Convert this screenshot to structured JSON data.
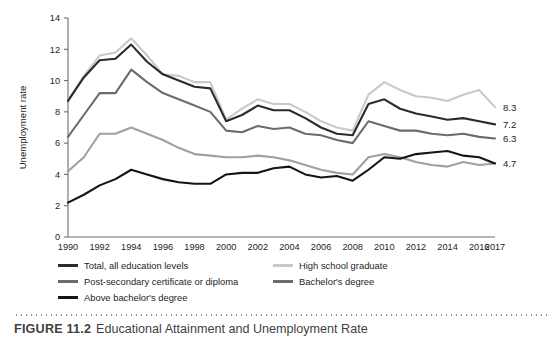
{
  "figure": {
    "caption_label": "FIGURE 11.2",
    "caption_text": "Educational Attainment and Unemployment Rate"
  },
  "chart_data": {
    "type": "line",
    "title": "",
    "xlabel": "",
    "ylabel": "Unemployment rate",
    "xlim": [
      1990,
      2017
    ],
    "ylim": [
      0,
      14
    ],
    "yticks": [
      0,
      2,
      4,
      6,
      8,
      10,
      12,
      14
    ],
    "grid": false,
    "legend_position": "below",
    "x": [
      1990,
      1991,
      1992,
      1993,
      1994,
      1995,
      1996,
      1997,
      1998,
      1999,
      2000,
      2001,
      2002,
      2003,
      2004,
      2005,
      2006,
      2007,
      2008,
      2009,
      2010,
      2011,
      2012,
      2013,
      2014,
      2015,
      2016,
      2017
    ],
    "xtick_labels": [
      "1990",
      "1992",
      "1994",
      "1996",
      "1998",
      "2000",
      "2002",
      "2004",
      "2006",
      "2008",
      "2010",
      "2012",
      "2014",
      "2016",
      "2017"
    ],
    "xtick_values": [
      1990,
      1992,
      1994,
      1996,
      1998,
      2000,
      2002,
      2004,
      2006,
      2008,
      2010,
      2012,
      2014,
      2016,
      2017
    ],
    "series": [
      {
        "name": "High school graduate",
        "color": "#c9c9cb",
        "end_label": "8.3",
        "values": [
          8.7,
          10.3,
          11.6,
          11.8,
          12.7,
          11.6,
          10.4,
          10.3,
          9.9,
          9.9,
          7.5,
          8.2,
          8.8,
          8.5,
          8.5,
          8.0,
          7.4,
          7.0,
          6.8,
          9.1,
          9.9,
          9.4,
          9.0,
          8.9,
          8.7,
          9.1,
          9.4,
          8.3
        ]
      },
      {
        "name": "Total, all education levels",
        "color": "#2b2b2e",
        "end_label": "7.2",
        "values": [
          8.7,
          10.2,
          11.3,
          11.4,
          12.3,
          11.2,
          10.4,
          10.0,
          9.6,
          9.5,
          7.4,
          7.8,
          8.4,
          8.1,
          8.1,
          7.6,
          7.0,
          6.6,
          6.5,
          8.5,
          8.8,
          8.2,
          7.9,
          7.7,
          7.5,
          7.6,
          7.4,
          7.2
        ]
      },
      {
        "name": "Post-secondary certificate or diploma",
        "color": "#6b6b70",
        "end_label": "6.3",
        "values": [
          6.4,
          7.8,
          9.2,
          9.2,
          10.7,
          9.9,
          9.2,
          8.8,
          8.4,
          8.0,
          6.8,
          6.7,
          7.1,
          6.9,
          7.0,
          6.6,
          6.5,
          6.2,
          6.0,
          7.4,
          7.1,
          6.8,
          6.8,
          6.6,
          6.5,
          6.6,
          6.4,
          6.3
        ]
      },
      {
        "name": "Bachelor's degree",
        "color": "#a0a0a4",
        "end_label": "4.7",
        "values": [
          4.2,
          5.1,
          6.6,
          6.6,
          7.0,
          6.6,
          6.2,
          5.7,
          5.3,
          5.2,
          5.1,
          5.1,
          5.2,
          5.1,
          4.9,
          4.6,
          4.3,
          4.1,
          4.0,
          5.1,
          5.3,
          5.1,
          4.8,
          4.6,
          4.5,
          4.8,
          4.6,
          4.7
        ]
      },
      {
        "name": "Above bachelor's degree",
        "color": "#141416",
        "end_label": "",
        "values": [
          2.2,
          2.7,
          3.3,
          3.7,
          4.3,
          4.0,
          3.7,
          3.5,
          3.4,
          3.4,
          4.0,
          4.1,
          4.1,
          4.4,
          4.5,
          4.0,
          3.8,
          3.9,
          3.6,
          4.3,
          5.1,
          5.0,
          5.3,
          5.4,
          5.5,
          5.2,
          5.1,
          4.7
        ]
      }
    ]
  },
  "legend": {
    "columns": [
      {
        "items": [
          {
            "label": "Total, all education levels",
            "color": "#2b2b2e"
          },
          {
            "label": "Post-secondary certificate or diploma",
            "color": "#6b6b70"
          },
          {
            "label": "Above bachelor's degree",
            "color": "#141416"
          }
        ]
      },
      {
        "items": [
          {
            "label": "High school graduate",
            "color": "#c9c9cb"
          },
          {
            "label": "Bachelor's degree",
            "color": "#6b6b70"
          }
        ]
      }
    ]
  }
}
